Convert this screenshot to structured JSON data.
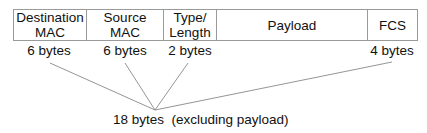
{
  "frame": {
    "fields": [
      {
        "label": "Destination\nMAC",
        "size": "6 bytes"
      },
      {
        "label": "Source\nMAC",
        "size": "6 bytes"
      },
      {
        "label": "Type/\nLength",
        "size": "2 bytes"
      },
      {
        "label": "Payload",
        "size": ""
      },
      {
        "label": "FCS",
        "size": "4 bytes"
      }
    ]
  },
  "total": {
    "label": "18 bytes  (excluding payload)"
  },
  "colors": {
    "border": "#9a9a9a",
    "line": "#7a7a7a",
    "text": "#111111"
  }
}
